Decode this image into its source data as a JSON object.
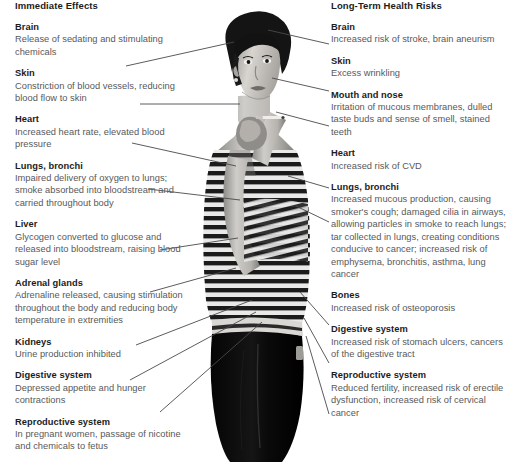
{
  "figure": {
    "title_left": "Immediate Effects",
    "title_right": "Long-Term Health Risks",
    "subject_description": "grayscale photograph of a young woman in a horizontally striped sleeveless top and black trousers, holding a lit cigarette near her face",
    "colors": {
      "heading": "#1c1c1c",
      "body_text": "#58595b",
      "leader_line": "#4a4a4a",
      "background": "#ffffff"
    }
  },
  "immediate_effects": [
    {
      "organ": "Brain",
      "effect": "Release of sedating and stimulating chemicals"
    },
    {
      "organ": "Skin",
      "effect": "Constriction of blood vessels, reducing blood flow to skin"
    },
    {
      "organ": "Heart",
      "effect": "Increased heart rate, elevated blood pressure"
    },
    {
      "organ": "Lungs, bronchi",
      "effect": "Impaired delivery of oxygen to lungs; smoke absorbed into bloodstream and carried throughout body"
    },
    {
      "organ": "Liver",
      "effect": "Glycogen converted to glucose and released into bloodstream, raising blood sugar level"
    },
    {
      "organ": "Adrenal glands",
      "effect": "Adrenaline released, causing stimulation throughout the body and reducing body temperature in extremities"
    },
    {
      "organ": "Kidneys",
      "effect": "Urine production inhibited"
    },
    {
      "organ": "Digestive system",
      "effect": "Depressed appetite and hunger contractions"
    },
    {
      "organ": "Reproductive system",
      "effect": "In pregnant women, passage of nicotine and chemicals to fetus"
    }
  ],
  "long_term_risks": [
    {
      "organ": "Brain",
      "effect": "Increased risk of stroke, brain aneurism"
    },
    {
      "organ": "Skin",
      "effect": "Excess wrinkling"
    },
    {
      "organ": "Mouth and nose",
      "effect": "Irritation of mucous membranes, dulled taste buds and sense of smell, stained teeth"
    },
    {
      "organ": "Heart",
      "effect": "Increased risk of CVD"
    },
    {
      "organ": "Lungs, bronchi",
      "effect": "Increased mucous production, causing smoker's cough; damaged cilia in airways, allowing particles in smoke to reach lungs; tar collected in lungs, creating conditions conducive to cancer; increased risk of emphysema, bronchitis, asthma, lung cancer"
    },
    {
      "organ": "Bones",
      "effect": "Increased risk of osteoporosis"
    },
    {
      "organ": "Digestive system",
      "effect": "Increased risk of stomach ulcers, cancers of the digestive tract"
    },
    {
      "organ": "Reproductive system",
      "effect": "Reduced fertility, increased risk of erectile dysfunction, increased risk of cervical cancer"
    }
  ]
}
